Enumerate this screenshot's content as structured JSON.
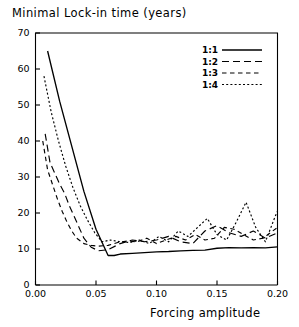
{
  "chart_data": {
    "type": "line",
    "title": "Minimal Lock-in time (years)",
    "xlabel": "Forcing amplitude",
    "ylabel": "",
    "xlim": [
      0.0,
      0.2
    ],
    "ylim": [
      0,
      70
    ],
    "xticks": [
      0.0,
      0.05,
      0.1,
      0.15,
      0.2
    ],
    "xticklabels": [
      "0.00",
      "0.05",
      "0.10",
      "0.15",
      "0.20"
    ],
    "yticks": [
      0,
      10,
      20,
      30,
      40,
      50,
      60,
      70
    ],
    "yticklabels": [
      "0",
      "10",
      "20",
      "30",
      "40",
      "50",
      "60",
      "70"
    ],
    "grid": false,
    "legend_position": "upper right",
    "legend_entries": [
      "1:1",
      "1:2",
      "1:3",
      "1:4"
    ],
    "series": [
      {
        "name": "1:1",
        "style": "solid",
        "x": [
          0.01,
          0.02,
          0.03,
          0.04,
          0.05,
          0.06,
          0.065,
          0.07,
          0.08,
          0.09,
          0.1,
          0.11,
          0.12,
          0.13,
          0.14,
          0.15,
          0.16,
          0.17,
          0.18,
          0.19,
          0.2
        ],
        "y": [
          65.0,
          51.0,
          38.5,
          26.0,
          15.5,
          8.2,
          8.2,
          8.6,
          8.8,
          9.0,
          9.2,
          9.3,
          9.5,
          9.6,
          9.7,
          10.2,
          10.4,
          10.3,
          10.4,
          10.3,
          10.6
        ]
      },
      {
        "name": "1:2",
        "style": "long-dash",
        "x": [
          0.008,
          0.012,
          0.016,
          0.02,
          0.024,
          0.028,
          0.032,
          0.036,
          0.04,
          0.046,
          0.052,
          0.06,
          0.07,
          0.08,
          0.09,
          0.1,
          0.11,
          0.12,
          0.13,
          0.14,
          0.15,
          0.16,
          0.17,
          0.18,
          0.19,
          0.2
        ],
        "y": [
          42.0,
          34.0,
          31.0,
          28.0,
          25.5,
          22.0,
          19.0,
          16.0,
          13.0,
          10.5,
          9.5,
          9.8,
          11.5,
          12.5,
          12.0,
          12.5,
          13.5,
          12.0,
          11.5,
          15.0,
          16.5,
          14.5,
          13.5,
          15.0,
          13.0,
          14.5
        ]
      },
      {
        "name": "1:3",
        "style": "dash",
        "x": [
          0.006,
          0.01,
          0.014,
          0.018,
          0.022,
          0.026,
          0.03,
          0.034,
          0.04,
          0.046,
          0.052,
          0.06,
          0.068,
          0.076,
          0.084,
          0.092,
          0.1,
          0.108,
          0.116,
          0.124,
          0.132,
          0.14,
          0.148,
          0.156,
          0.164,
          0.172,
          0.18,
          0.188,
          0.196,
          0.2
        ],
        "y": [
          40.0,
          32.0,
          28.0,
          24.0,
          20.5,
          17.5,
          15.0,
          13.0,
          11.5,
          11.0,
          10.8,
          11.0,
          11.8,
          12.2,
          12.0,
          13.0,
          11.5,
          12.5,
          13.5,
          12.5,
          14.0,
          12.5,
          13.0,
          16.0,
          15.5,
          14.0,
          12.5,
          13.0,
          15.0,
          16.0
        ]
      },
      {
        "name": "1:4",
        "style": "dot",
        "x": [
          0.007,
          0.013,
          0.019,
          0.025,
          0.031,
          0.037,
          0.043,
          0.049,
          0.055,
          0.062,
          0.07,
          0.078,
          0.086,
          0.094,
          0.102,
          0.11,
          0.118,
          0.126,
          0.134,
          0.142,
          0.15,
          0.158,
          0.166,
          0.174,
          0.182,
          0.19,
          0.198,
          0.2
        ],
        "y": [
          58.0,
          48.0,
          40.0,
          33.0,
          27.0,
          22.0,
          18.0,
          14.5,
          12.0,
          12.5,
          12.0,
          11.8,
          12.5,
          11.5,
          13.5,
          12.0,
          15.0,
          13.5,
          16.0,
          18.5,
          14.0,
          12.5,
          17.5,
          23.0,
          16.0,
          12.0,
          19.0,
          20.5
        ]
      }
    ],
    "colors": {
      "line": "#000000",
      "axis": "#000000",
      "background": "#ffffff"
    }
  },
  "legend": {
    "items": [
      {
        "label": "1:1"
      },
      {
        "label": "1:2"
      },
      {
        "label": "1:3"
      },
      {
        "label": "1:4"
      }
    ]
  }
}
